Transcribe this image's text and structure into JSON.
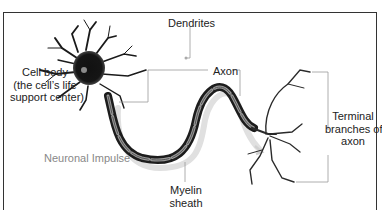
{
  "diagram": {
    "labels": {
      "dendrites": "Dendrites",
      "cell_body": [
        "Cell body",
        "(the cell’s life",
        "support center)"
      ],
      "axon": "Axon",
      "terminal": [
        "Terminal",
        "branches of",
        "axon"
      ],
      "impulse": "Neuronal Impulse",
      "myelin": [
        "Myelin",
        "sheath"
      ]
    },
    "colors": {
      "frame": "#333333",
      "leader_lines": "#9a9a9a",
      "neuron": "#1a1a1a",
      "impulse_path": "#d8d8d8",
      "impulse_text": "#888888"
    }
  }
}
